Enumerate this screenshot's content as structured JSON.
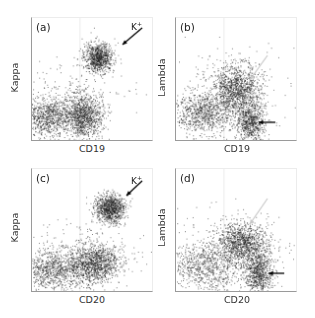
{
  "figure": {
    "type": "flow-cytometry-dot-plots",
    "panels": [
      {
        "id": "a",
        "letter": "(a)",
        "xlabel": "CD19",
        "ylabel": "Kappa",
        "annotation": {
          "text": "K",
          "sup": "+"
        },
        "black_arrow": {
          "from": [
            112,
            10
          ],
          "to": [
            92,
            27
          ]
        },
        "clusters": [
          {
            "cx": 0.55,
            "cy": 0.32,
            "sx": 0.06,
            "sy": 0.06,
            "n": 900
          },
          {
            "cx": 0.42,
            "cy": 0.8,
            "sx": 0.08,
            "sy": 0.09,
            "n": 1100
          },
          {
            "cx": 0.12,
            "cy": 0.81,
            "sx": 0.1,
            "sy": 0.08,
            "n": 800
          },
          {
            "cx": 0.3,
            "cy": 0.7,
            "sx": 0.25,
            "sy": 0.18,
            "n": 300
          }
        ]
      },
      {
        "id": "b",
        "letter": "(b)",
        "xlabel": "CD19",
        "ylabel": "Lambda",
        "annotation": null,
        "black_arrow": {
          "from": [
            101,
            106
          ],
          "to": [
            84,
            106
          ]
        },
        "gray_arrow": {
          "from": [
            93,
            38
          ],
          "to": [
            75,
            63
          ]
        },
        "clusters": [
          {
            "cx": 0.5,
            "cy": 0.58,
            "sx": 0.1,
            "sy": 0.1,
            "n": 1200
          },
          {
            "cx": 0.62,
            "cy": 0.85,
            "sx": 0.06,
            "sy": 0.08,
            "n": 700
          },
          {
            "cx": 0.22,
            "cy": 0.78,
            "sx": 0.12,
            "sy": 0.08,
            "n": 800
          },
          {
            "cx": 0.4,
            "cy": 0.65,
            "sx": 0.25,
            "sy": 0.18,
            "n": 300
          }
        ]
      },
      {
        "id": "c",
        "letter": "(c)",
        "xlabel": "CD20",
        "ylabel": "Kappa",
        "annotation": {
          "text": "K",
          "sup": "+"
        },
        "black_arrow": {
          "from": [
            112,
            12
          ],
          "to": [
            96,
            27
          ]
        },
        "clusters": [
          {
            "cx": 0.65,
            "cy": 0.32,
            "sx": 0.06,
            "sy": 0.06,
            "n": 1000
          },
          {
            "cx": 0.52,
            "cy": 0.77,
            "sx": 0.1,
            "sy": 0.08,
            "n": 1100
          },
          {
            "cx": 0.18,
            "cy": 0.82,
            "sx": 0.14,
            "sy": 0.08,
            "n": 900
          },
          {
            "cx": 0.4,
            "cy": 0.72,
            "sx": 0.25,
            "sy": 0.15,
            "n": 300
          }
        ]
      },
      {
        "id": "d",
        "letter": "(d)",
        "xlabel": "CD20",
        "ylabel": "Lambda",
        "annotation": null,
        "black_arrow": {
          "from": [
            110,
            106
          ],
          "to": [
            94,
            106
          ]
        },
        "gray_arrow": {
          "from": [
            93,
            30
          ],
          "to": [
            75,
            56
          ]
        },
        "clusters": [
          {
            "cx": 0.55,
            "cy": 0.6,
            "sx": 0.11,
            "sy": 0.08,
            "n": 1100
          },
          {
            "cx": 0.68,
            "cy": 0.85,
            "sx": 0.06,
            "sy": 0.09,
            "n": 800
          },
          {
            "cx": 0.22,
            "cy": 0.8,
            "sx": 0.15,
            "sy": 0.09,
            "n": 700
          },
          {
            "cx": 0.42,
            "cy": 0.7,
            "sx": 0.25,
            "sy": 0.18,
            "n": 350
          }
        ]
      }
    ],
    "colors": {
      "dots": "#1a1a1a",
      "axis": "#9a9a9a",
      "gray_arrow": "#c8c8c8",
      "black_arrow": "#000000"
    }
  }
}
